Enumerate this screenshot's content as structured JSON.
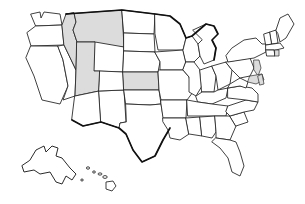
{
  "figure": {
    "name": "united-states-map",
    "background_color": "#ffffff",
    "outline_color": "#2b2b2b",
    "border_color": "#111111",
    "highlight_color": "#dcdcdc",
    "default_state_fill": "#ffffff"
  },
  "legend": {
    "highlighted_label": "Highlighted state",
    "default_label": "Unhighlighted state"
  },
  "map_data": {
    "type": "choropleth",
    "region": "United States",
    "projection": "albers-usa",
    "highlight_count": 4,
    "highlighted_states": [
      "Montana",
      "Idaho",
      "Utah",
      "Kansas"
    ],
    "highlighted_slivers": [
      "New Jersey",
      "Delaware",
      "Maryland",
      "Rhode Island"
    ],
    "insets": [
      "Alaska",
      "Hawaii"
    ],
    "states": [
      {
        "code": "WA",
        "name": "Washington",
        "highlighted": false
      },
      {
        "code": "OR",
        "name": "Oregon",
        "highlighted": false
      },
      {
        "code": "CA",
        "name": "California",
        "highlighted": false
      },
      {
        "code": "NV",
        "name": "Nevada",
        "highlighted": false
      },
      {
        "code": "ID",
        "name": "Idaho",
        "highlighted": true
      },
      {
        "code": "MT",
        "name": "Montana",
        "highlighted": true
      },
      {
        "code": "WY",
        "name": "Wyoming",
        "highlighted": false
      },
      {
        "code": "UT",
        "name": "Utah",
        "highlighted": true
      },
      {
        "code": "AZ",
        "name": "Arizona",
        "highlighted": false
      },
      {
        "code": "NM",
        "name": "New Mexico",
        "highlighted": false
      },
      {
        "code": "CO",
        "name": "Colorado",
        "highlighted": false
      },
      {
        "code": "ND",
        "name": "North Dakota",
        "highlighted": false
      },
      {
        "code": "SD",
        "name": "South Dakota",
        "highlighted": false
      },
      {
        "code": "NE",
        "name": "Nebraska",
        "highlighted": false
      },
      {
        "code": "KS",
        "name": "Kansas",
        "highlighted": true
      },
      {
        "code": "OK",
        "name": "Oklahoma",
        "highlighted": false
      },
      {
        "code": "TX",
        "name": "Texas",
        "highlighted": false
      },
      {
        "code": "MN",
        "name": "Minnesota",
        "highlighted": false
      },
      {
        "code": "IA",
        "name": "Iowa",
        "highlighted": false
      },
      {
        "code": "MO",
        "name": "Missouri",
        "highlighted": false
      },
      {
        "code": "AR",
        "name": "Arkansas",
        "highlighted": false
      },
      {
        "code": "LA",
        "name": "Louisiana",
        "highlighted": false
      },
      {
        "code": "WI",
        "name": "Wisconsin",
        "highlighted": false
      },
      {
        "code": "IL",
        "name": "Illinois",
        "highlighted": false
      },
      {
        "code": "MI",
        "name": "Michigan",
        "highlighted": false
      },
      {
        "code": "IN",
        "name": "Indiana",
        "highlighted": false
      },
      {
        "code": "OH",
        "name": "Ohio",
        "highlighted": false
      },
      {
        "code": "KY",
        "name": "Kentucky",
        "highlighted": false
      },
      {
        "code": "TN",
        "name": "Tennessee",
        "highlighted": false
      },
      {
        "code": "MS",
        "name": "Mississippi",
        "highlighted": false
      },
      {
        "code": "AL",
        "name": "Alabama",
        "highlighted": false
      },
      {
        "code": "GA",
        "name": "Georgia",
        "highlighted": false
      },
      {
        "code": "FL",
        "name": "Florida",
        "highlighted": false
      },
      {
        "code": "SC",
        "name": "South Carolina",
        "highlighted": false
      },
      {
        "code": "NC",
        "name": "North Carolina",
        "highlighted": false
      },
      {
        "code": "VA",
        "name": "Virginia",
        "highlighted": false
      },
      {
        "code": "WV",
        "name": "West Virginia",
        "highlighted": false
      },
      {
        "code": "PA",
        "name": "Pennsylvania",
        "highlighted": false
      },
      {
        "code": "NY",
        "name": "New York",
        "highlighted": false
      },
      {
        "code": "VT",
        "name": "Vermont",
        "highlighted": false
      },
      {
        "code": "NH",
        "name": "New Hampshire",
        "highlighted": false
      },
      {
        "code": "ME",
        "name": "Maine",
        "highlighted": false
      },
      {
        "code": "MA",
        "name": "Massachusetts",
        "highlighted": false
      },
      {
        "code": "CT",
        "name": "Connecticut",
        "highlighted": false
      },
      {
        "code": "RI",
        "name": "Rhode Island",
        "highlighted": true
      },
      {
        "code": "NJ",
        "name": "New Jersey",
        "highlighted": true
      },
      {
        "code": "DE",
        "name": "Delaware",
        "highlighted": true
      },
      {
        "code": "MD",
        "name": "Maryland",
        "highlighted": true
      },
      {
        "code": "AK",
        "name": "Alaska",
        "highlighted": false
      },
      {
        "code": "HI",
        "name": "Hawaii",
        "highlighted": false
      }
    ]
  }
}
